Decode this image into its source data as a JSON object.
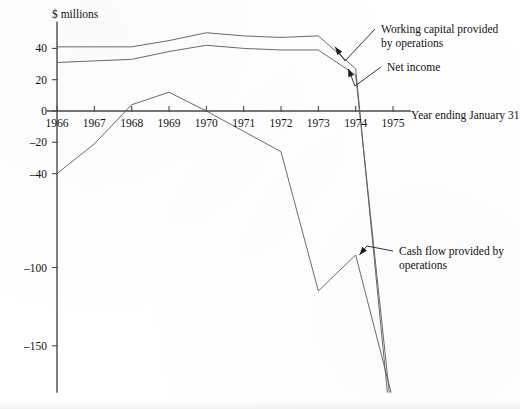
{
  "chart_data": {
    "type": "line",
    "title": "",
    "subtitle": "",
    "unit_label": "$ millions",
    "xlabel": "Year ending January 31",
    "ylabel": "",
    "x": [
      1966,
      1967,
      1968,
      1969,
      1970,
      1971,
      1972,
      1973,
      1974,
      1975
    ],
    "xtick_labels": [
      "1966",
      "1967",
      "1968",
      "1969",
      "1970",
      "1971",
      "1972",
      "1973",
      "1974",
      "1975"
    ],
    "ytick_labels": [
      "40",
      "20",
      "0",
      "–20",
      "–40",
      "–100",
      "–150"
    ],
    "ytick_values": [
      40,
      20,
      0,
      -20,
      -40,
      -100,
      -150
    ],
    "ylim": [
      -180,
      52
    ],
    "xlim": [
      1966,
      1975
    ],
    "grid": false,
    "legend": "annotations",
    "series": [
      {
        "name": "Working capital provided by operations",
        "x": [
          1966,
          1967,
          1968,
          1969,
          1970,
          1971,
          1972,
          1973,
          1974,
          1974.85
        ],
        "values": [
          41,
          41,
          41,
          45,
          50,
          48,
          47,
          48,
          27,
          -180
        ]
      },
      {
        "name": "Net income",
        "x": [
          1966,
          1967,
          1968,
          1969,
          1970,
          1971,
          1972,
          1973,
          1974,
          1974.9
        ],
        "values": [
          31,
          32,
          33,
          38,
          42,
          40,
          39,
          39,
          23,
          -180
        ]
      },
      {
        "name": "Cash flow provided by operations",
        "x": [
          1966,
          1967,
          1968,
          1969,
          1970,
          1971,
          1972,
          1973,
          1974,
          1974.95
        ],
        "values": [
          -40,
          -21,
          4,
          12,
          0,
          -13,
          -26,
          -115,
          -92,
          -180
        ]
      }
    ],
    "annotations": [
      {
        "id": "working-capital",
        "text_line1": "Working capital provided",
        "text_line2": "by operations",
        "target_x": 1973.45,
        "target_y": 41
      },
      {
        "id": "net-income",
        "text_line1": "Net income",
        "text_line2": "",
        "target_x": 1973.8,
        "target_y": 27
      },
      {
        "id": "cash-flow",
        "text_line1": "Cash flow provided by",
        "text_line2": "operations",
        "target_x": 1974.1,
        "target_y": -92
      }
    ]
  },
  "colors": {
    "axis": "#4a4a4a",
    "series": "#5a5a5a",
    "text": "#111111",
    "background": "#ffffff"
  }
}
